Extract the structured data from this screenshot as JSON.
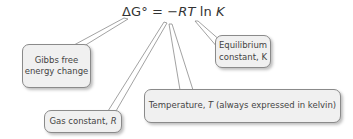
{
  "formula": {
    "delta": "ΔG°",
    "equals": " = ",
    "minus": "−",
    "rt": "RT",
    "ln": " ln ",
    "k": "K"
  },
  "callouts": {
    "gibbs": {
      "line1": "Gibbs free",
      "line2": "energy change"
    },
    "equilibrium": {
      "line1": "Equilibrium",
      "line2_text": "constant, ",
      "line2_var": "K"
    },
    "temperature": {
      "text_before": "Temperature, ",
      "var": "T",
      "text_after": " (always expressed in kelvin)"
    },
    "gas": {
      "text": "Gas constant, ",
      "var": "R"
    }
  },
  "colors": {
    "box_fill": "#f0f0f0",
    "box_border": "#8a8a8a",
    "text": "#3a3a3a"
  }
}
